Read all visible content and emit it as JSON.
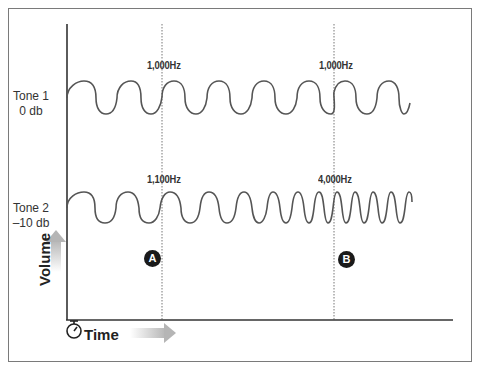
{
  "diagram": {
    "type": "waveform-comparison",
    "tones": [
      {
        "name": "Tone 1",
        "level": "0 db",
        "segments": [
          {
            "frequency": "1,000Hz"
          }
        ]
      },
      {
        "name": "Tone 2",
        "level": "–10 db",
        "segments": [
          {
            "frequency": "1,100Hz"
          },
          {
            "frequency": "4,000Hz"
          }
        ]
      }
    ],
    "frequency_labels": {
      "tone1_a": "1,000Hz",
      "tone1_b": "1,000Hz",
      "tone2_a": "1,100Hz",
      "tone2_b": "4,000Hz"
    },
    "markers": {
      "a": "A",
      "b": "B"
    },
    "axes": {
      "x_label": "Time",
      "y_label": "Volume"
    },
    "labels": {
      "tone1_name": "Tone 1",
      "tone1_level": "0 db",
      "tone2_name": "Tone 2",
      "tone2_level": "–10 db"
    },
    "icons": {
      "time": "stopwatch-icon",
      "x_arrow": "right-arrow-icon",
      "y_arrow": "up-arrow-icon"
    },
    "colors": {
      "wave": "#555555",
      "axis": "#333333",
      "guide": "#777777",
      "marker_bg": "#1a1a1a",
      "arrow_grad_end": "#b8b8b8"
    }
  }
}
